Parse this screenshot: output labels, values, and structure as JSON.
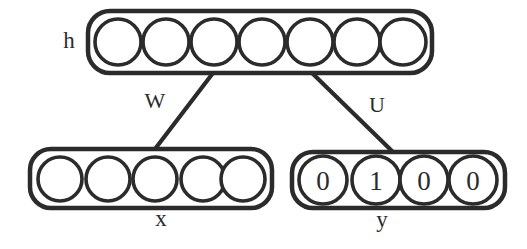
{
  "diagram": {
    "stroke_color": "#2b2b2b",
    "background_color": "#ffffff",
    "layers": [
      {
        "id": "hidden",
        "label": "h",
        "label_position": "left",
        "unit_count": 7,
        "units": [
          "",
          "",
          "",
          "",
          "",
          "",
          ""
        ],
        "box": {
          "x": 88,
          "y": 11,
          "width": 344,
          "height": 62,
          "radius": 22
        }
      },
      {
        "id": "input",
        "label": "x",
        "label_position": "below",
        "unit_count": 5,
        "units": [
          "",
          "",
          "",
          "",
          ""
        ],
        "box": {
          "x": 30,
          "y": 149,
          "width": 242,
          "height": 59,
          "radius": 21
        }
      },
      {
        "id": "output",
        "label": "y",
        "label_position": "below",
        "unit_count": 4,
        "units": [
          "0",
          "1",
          "0",
          "0"
        ],
        "box": {
          "x": 292,
          "y": 152,
          "width": 213,
          "height": 56,
          "radius": 21
        }
      }
    ],
    "connections": [
      {
        "id": "W",
        "label": "W",
        "from_layer": "input",
        "to_layer": "hidden",
        "x1": 155,
        "y1": 149,
        "x2": 213,
        "y2": 73,
        "label_x": 155,
        "label_y": 103
      },
      {
        "id": "U",
        "label": "U",
        "from_layer": "hidden",
        "to_layer": "output",
        "x1": 312,
        "y1": 73,
        "x2": 393,
        "y2": 152,
        "label_x": 377,
        "label_y": 107
      }
    ],
    "labels": {
      "hidden_label": {
        "text": "h",
        "x": 69,
        "y": 43
      },
      "input_label": {
        "text": "x",
        "x": 161,
        "y": 221
      },
      "output_label": {
        "text": "y",
        "x": 382,
        "y": 222
      }
    }
  }
}
